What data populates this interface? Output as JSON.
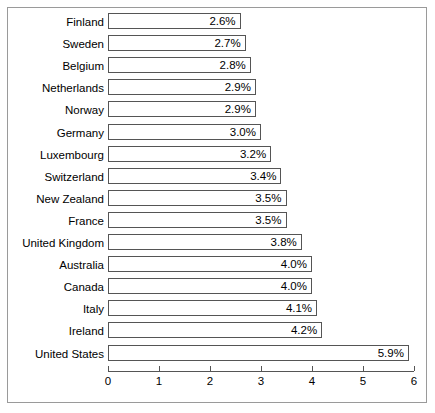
{
  "chart_data": {
    "type": "bar",
    "orientation": "horizontal",
    "title": "",
    "subtitle": "",
    "xlabel": "",
    "ylabel": "",
    "xlim": [
      0,
      6
    ],
    "xticks": [
      0,
      1,
      2,
      3,
      4,
      5,
      6
    ],
    "xtick_labels": [
      "0",
      "1",
      "2",
      "3",
      "4",
      "5",
      "6"
    ],
    "grid": false,
    "legend": null,
    "value_label_suffix": "%",
    "value_labels_inside_bars": true,
    "categories": [
      "Finland",
      "Sweden",
      "Belgium",
      "Netherlands",
      "Norway",
      "Germany",
      "Luxembourg",
      "Switzerland",
      "New Zealand",
      "France",
      "United Kingdom",
      "Australia",
      "Canada",
      "Italy",
      "Ireland",
      "United States"
    ],
    "values": [
      2.6,
      2.7,
      2.8,
      2.9,
      2.9,
      3.0,
      3.2,
      3.4,
      3.5,
      3.5,
      3.8,
      4.0,
      4.0,
      4.1,
      4.2,
      5.9
    ],
    "data_labels": [
      "2.6%",
      "2.7%",
      "2.8%",
      "2.9%",
      "2.9%",
      "3.0%",
      "3.2%",
      "3.4%",
      "3.5%",
      "3.5%",
      "3.8%",
      "4.0%",
      "4.0%",
      "4.1%",
      "4.2%",
      "5.9%"
    ],
    "colors": {
      "bar_fill": "#ffffff",
      "bar_border": "#555555",
      "axis": "#555555",
      "text": "#000000",
      "frame_border": "#9a9a9a",
      "background": "#ffffff"
    }
  }
}
